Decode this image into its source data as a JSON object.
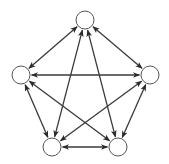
{
  "diagram": {
    "type": "complete-graph",
    "colors": {
      "background": "#ffffff",
      "node_fill": "#ffffff",
      "node_stroke": "#555555",
      "edge": "#3a3a3a"
    },
    "node_radius": 9,
    "nodes": [
      {
        "id": "top",
        "label": "",
        "x": 85,
        "y": 20
      },
      {
        "id": "left",
        "label": "",
        "x": 21,
        "y": 75
      },
      {
        "id": "right",
        "label": "",
        "x": 150,
        "y": 75
      },
      {
        "id": "bottom-left",
        "label": "",
        "x": 52,
        "y": 147
      },
      {
        "id": "bottom-right",
        "label": "",
        "x": 118,
        "y": 147
      }
    ],
    "edges": [
      {
        "from": "top",
        "to": "left",
        "direction": "both"
      },
      {
        "from": "top",
        "to": "right",
        "direction": "both"
      },
      {
        "from": "top",
        "to": "bottom-left",
        "direction": "both"
      },
      {
        "from": "top",
        "to": "bottom-right",
        "direction": "both"
      },
      {
        "from": "left",
        "to": "right",
        "direction": "both"
      },
      {
        "from": "left",
        "to": "bottom-left",
        "direction": "both"
      },
      {
        "from": "left",
        "to": "bottom-right",
        "direction": "both"
      },
      {
        "from": "right",
        "to": "bottom-left",
        "direction": "both"
      },
      {
        "from": "right",
        "to": "bottom-right",
        "direction": "both"
      },
      {
        "from": "bottom-left",
        "to": "bottom-right",
        "direction": "both"
      }
    ]
  }
}
